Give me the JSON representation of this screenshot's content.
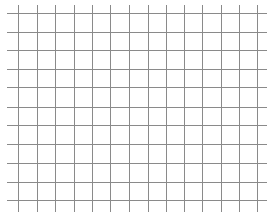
{
  "grid": {
    "background": "#ffffff",
    "line_color": "#8a8a8a",
    "vertical_lines": {
      "count": 14,
      "x_positions": [
        18,
        37,
        55,
        74,
        92,
        110,
        129,
        148,
        166,
        184,
        202,
        221,
        239,
        257
      ],
      "top": 5,
      "bottom": 212
    },
    "horizontal_lines": {
      "count": 11,
      "y_positions": [
        13,
        32,
        50,
        69,
        87,
        107,
        125,
        144,
        163,
        182,
        200
      ],
      "left": 7,
      "right": 267
    }
  }
}
